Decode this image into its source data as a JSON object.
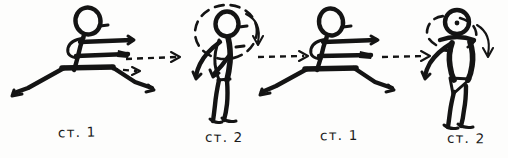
{
  "figure": {
    "background_color": "#fdfdfc",
    "ink_color": "#141414",
    "width": 508,
    "height": 158
  },
  "captions": [
    {
      "id": "caption-1",
      "text": "ст. 1",
      "x": 58,
      "y": 124
    },
    {
      "id": "caption-2",
      "text": "ст. 2",
      "x": 205,
      "y": 129
    },
    {
      "id": "caption-3",
      "text": "ст. 1",
      "x": 320,
      "y": 127
    },
    {
      "id": "caption-4",
      "text": "ст. 2",
      "x": 447,
      "y": 130
    }
  ],
  "poses": [
    {
      "id": "pose-1",
      "name": "low-lunge-stance",
      "caption": "ст. 1",
      "facing": "right",
      "description": "Crouched wide straddle stance, both arms extended forward"
    },
    {
      "id": "pose-2",
      "name": "upright-stance",
      "caption": "ст. 2",
      "facing": "right",
      "description": "Upright standing figure, arm drawn back, dashed rotation loop around head and torso with curved arrow"
    },
    {
      "id": "pose-3",
      "name": "low-lunge-stance",
      "caption": "ст. 1",
      "facing": "right",
      "description": "Crouched wide straddle stance, both arms extended forward"
    },
    {
      "id": "pose-4",
      "name": "upright-stance",
      "caption": "ст. 2",
      "facing": "front",
      "description": "Upright standing figure turned toward viewer, dashed rotation loop and curved arrow"
    }
  ],
  "transitions": [
    {
      "id": "transition-1",
      "from": "ст. 1",
      "to": "ст. 2",
      "direction": "right"
    },
    {
      "id": "transition-2",
      "from": "ст. 2",
      "to": "ст. 1",
      "direction": "right"
    },
    {
      "id": "transition-3",
      "from": "ст. 1",
      "to": "ст. 2",
      "direction": "right"
    }
  ],
  "annotations": {
    "rotation_marker_2": "curved-arrow-clockwise",
    "rotation_marker_4": "curved-arrow-clockwise"
  }
}
